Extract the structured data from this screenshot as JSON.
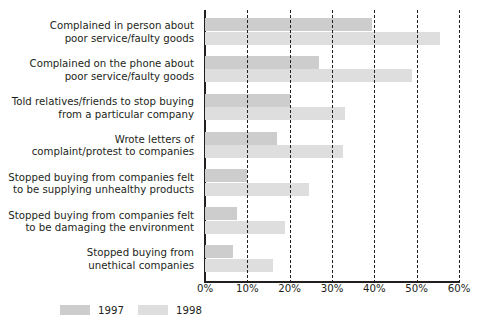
{
  "chart_data": {
    "type": "bar",
    "orientation": "horizontal",
    "title": "",
    "xlabel": "",
    "ylabel": "",
    "xlim": [
      0,
      60
    ],
    "xticks": [
      "0%",
      "10%",
      "20%",
      "30%",
      "40%",
      "50%",
      "60%"
    ],
    "xtick_values": [
      0,
      10,
      20,
      30,
      40,
      50,
      60
    ],
    "grid": true,
    "grid_style": "dashed-vertical",
    "legend_position": "bottom-left",
    "categories": [
      [
        "Complained in person about",
        "poor service/faulty goods"
      ],
      [
        "Complained on the phone about",
        "poor service/faulty goods"
      ],
      [
        "Told relatives/friends to stop buying",
        "from a particular company"
      ],
      [
        "Wrote letters of",
        "complaint/protest to companies"
      ],
      [
        "Stopped buying from companies felt",
        "to be supplying unhealthy products"
      ],
      [
        "Stopped buying from companies felt",
        "to be damaging the environment"
      ],
      [
        "Stopped buying from",
        "unethical companies"
      ]
    ],
    "series": [
      {
        "name": "1997",
        "color": "#cdcdcd",
        "values": [
          39.5,
          27.0,
          20.0,
          17.0,
          10.0,
          7.5,
          6.5
        ]
      },
      {
        "name": "1998",
        "color": "#dedede",
        "values": [
          55.5,
          49.0,
          33.0,
          32.5,
          24.5,
          19.0,
          16.0
        ]
      }
    ]
  },
  "legend": {
    "items": [
      {
        "label": "1997",
        "color": "#cdcdcd"
      },
      {
        "label": "1998",
        "color": "#dedede"
      }
    ]
  },
  "colors": {
    "axis": "#231f20",
    "text": "#231f20",
    "background": "#ffffff",
    "series_1997": "#cdcdcd",
    "series_1998": "#dedede"
  }
}
